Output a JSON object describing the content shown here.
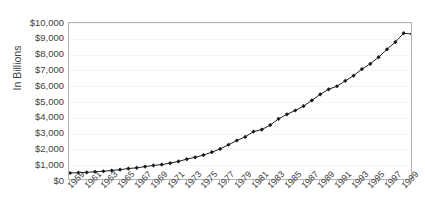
{
  "chart_data": {
    "type": "line",
    "title": "",
    "xlabel": "",
    "ylabel": "In Billions",
    "ylim": [
      0,
      10000
    ],
    "ytick_labels": [
      "$10,000",
      "$9,000",
      "$8,000",
      "$7,000",
      "$6,000",
      "$5,000",
      "$4,000",
      "$3,000",
      "$2,000",
      "$1,000",
      "$0"
    ],
    "ytick_values": [
      10000,
      9000,
      8000,
      7000,
      6000,
      5000,
      4000,
      3000,
      2000,
      1000,
      0
    ],
    "xlim": [
      1959,
      2000
    ],
    "xtick_labels": [
      "1959",
      "1961",
      "1963",
      "1965",
      "1967",
      "1969",
      "1971",
      "1973",
      "1975",
      "1977",
      "1979",
      "1981",
      "1983",
      "1985",
      "1987",
      "1989",
      "1991",
      "1993",
      "1995",
      "1997",
      "1999"
    ],
    "xtick_values": [
      1959,
      1961,
      1963,
      1965,
      1967,
      1969,
      1971,
      1973,
      1975,
      1977,
      1979,
      1981,
      1983,
      1985,
      1987,
      1989,
      1991,
      1993,
      1995,
      1997,
      1999
    ],
    "grid": true,
    "grid_axis": "y",
    "legend": false,
    "legend_position": "none",
    "marker": "diamond",
    "line_color": "#222222",
    "marker_color": "#1a1a1a",
    "grid_color": "#f4f4f4",
    "frame_color": "#b4b4b4",
    "x": [
      1959,
      1960,
      1961,
      1962,
      1963,
      1964,
      1965,
      1966,
      1967,
      1968,
      1969,
      1970,
      1971,
      1972,
      1973,
      1974,
      1975,
      1976,
      1977,
      1978,
      1979,
      1980,
      1981,
      1982,
      1983,
      1984,
      1985,
      1986,
      1987,
      1988,
      1989,
      1990,
      1991,
      1992,
      1993,
      1994,
      1995,
      1996,
      1997,
      1998,
      1999,
      2000
    ],
    "values": [
      506,
      527,
      545,
      586,
      618,
      664,
      719,
      788,
      833,
      910,
      985,
      1039,
      1129,
      1238,
      1383,
      1500,
      1638,
      1825,
      2031,
      2294,
      2563,
      2790,
      3128,
      3255,
      3537,
      3933,
      4220,
      4463,
      4740,
      5104,
      5484,
      5803,
      5996,
      6338,
      6667,
      7085,
      7415,
      7839,
      8332,
      8794,
      9354,
      9300
    ]
  }
}
